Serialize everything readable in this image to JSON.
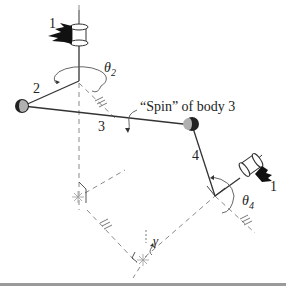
{
  "figure": {
    "type": "spatial-linkage-diagram",
    "colors": {
      "line": "#333333",
      "dashed": "#8a8a8a",
      "joint_dark": "#222222",
      "joint_light": "#b0b0b0",
      "ground": "#111111",
      "rule": "#9a9a9a"
    },
    "labels": {
      "ground_top": "1",
      "ground_right": "1",
      "link2": "2",
      "link3": "3",
      "link4": "4",
      "theta2": "θ",
      "theta2_sub": "2",
      "theta4": "θ",
      "theta4_sub": "4",
      "gamma": "γ",
      "spin_caption": "“Spin” of body 3"
    },
    "elements": [
      {
        "name": "ground-1-top",
        "kind": "revolute-joint-ground"
      },
      {
        "name": "crank-2",
        "kind": "link"
      },
      {
        "name": "coupler-3",
        "kind": "link"
      },
      {
        "name": "follower-4",
        "kind": "link"
      },
      {
        "name": "ground-1-right",
        "kind": "revolute-joint-ground"
      },
      {
        "name": "spherical-joint-left",
        "kind": "spherical-joint"
      },
      {
        "name": "spherical-joint-right",
        "kind": "spherical-joint"
      }
    ]
  }
}
